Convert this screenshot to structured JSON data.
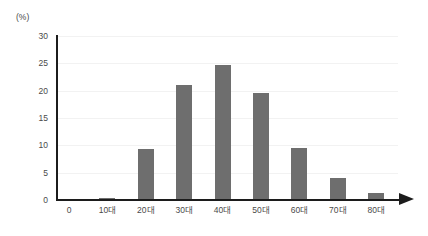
{
  "chart_data": {
    "type": "bar",
    "title": "",
    "subtitle": "",
    "xlabel": "",
    "ylabel": "",
    "unit_label": "(%)",
    "categories": [
      "0",
      "10대",
      "20대",
      "30대",
      "40대",
      "50대",
      "60대",
      "70대",
      "80대"
    ],
    "values": [
      0,
      0.4,
      9.3,
      21.0,
      24.7,
      19.5,
      9.5,
      4.0,
      1.2
    ],
    "ylim": [
      0,
      30
    ],
    "y_ticks": [
      0,
      5,
      10,
      15,
      20,
      25,
      30
    ],
    "y_tick_labels": [
      "0",
      "5",
      "10",
      "15",
      "20",
      "25",
      "30"
    ],
    "grid": true,
    "grid_axis": "y",
    "legend": false,
    "legend_position": "none",
    "bar_color": "#6e6e6e",
    "axis_color": "#1c1c1c",
    "grid_color": "#f2f2f2",
    "tick_label_color": "#4a4a4a",
    "background_color": "#ffffff",
    "x_axis_arrow": true
  }
}
